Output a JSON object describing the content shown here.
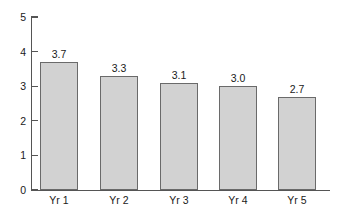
{
  "chart_data": {
    "type": "bar",
    "title": "",
    "subtitle": "",
    "xlabel": "",
    "ylabel": "",
    "categories": [
      "Yr 1",
      "Yr 2",
      "Yr 3",
      "Yr 4",
      "Yr 5"
    ],
    "values": [
      3.7,
      3.3,
      3.1,
      3.0,
      2.7
    ],
    "value_labels": [
      "3.7",
      "3.3",
      "3.1",
      "3.0",
      "2.7"
    ],
    "ylim": [
      0,
      5
    ],
    "yticks": [
      0,
      1,
      2,
      3,
      4,
      5
    ],
    "ytick_labels": [
      "0",
      "1",
      "2",
      "3",
      "4",
      "5"
    ],
    "xtick_labels": [
      "Yr 1",
      "Yr 2",
      "Yr 3",
      "Yr 4",
      "Yr 5"
    ],
    "grid": false,
    "legend": null,
    "legend_position": "none",
    "bar_fill_color": "#d2d2d2",
    "bar_edge_color": "#6a6a6a",
    "axis_color": "#555555",
    "text_color": "#1a1a1a",
    "background_color": "#ffffff",
    "data_labels_shown": true
  }
}
